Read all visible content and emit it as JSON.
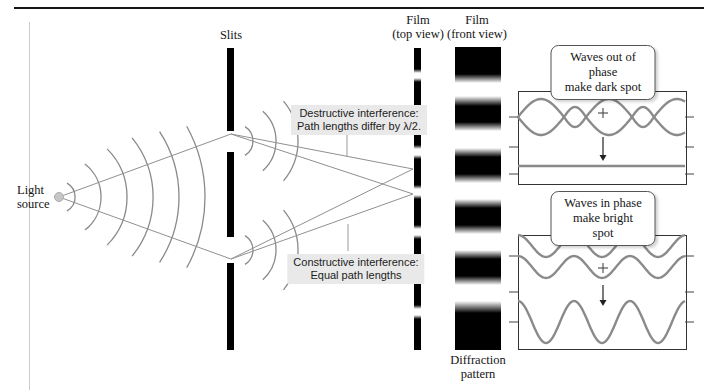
{
  "figure": {
    "labels": {
      "light_source": "Light\nsource",
      "slits": "Slits",
      "film_top": "Film\n(top view)",
      "film_front": "Film\n(front view)",
      "diffraction": "Diffraction\npattern"
    },
    "annotations": {
      "destructive": "Destructive interference:\nPath lengths differ by λ/2.",
      "constructive": "Constructive interference:\nEqual path lengths"
    },
    "callouts": {
      "out_of_phase": "Waves out of phase\nmake dark spot",
      "in_phase": "Waves in phase\nmake bright spot"
    },
    "colors": {
      "wave_gray": "#8a8a8a",
      "line_gray": "#909090",
      "leader_gray": "#9a9a9a",
      "tick_dark": "#444444",
      "arrow_dark": "#222222",
      "plus_gray": "#555555",
      "label_bg": "#e9e9e9",
      "film_black": "#000000",
      "source_dot": "#c6c6c6"
    }
  }
}
